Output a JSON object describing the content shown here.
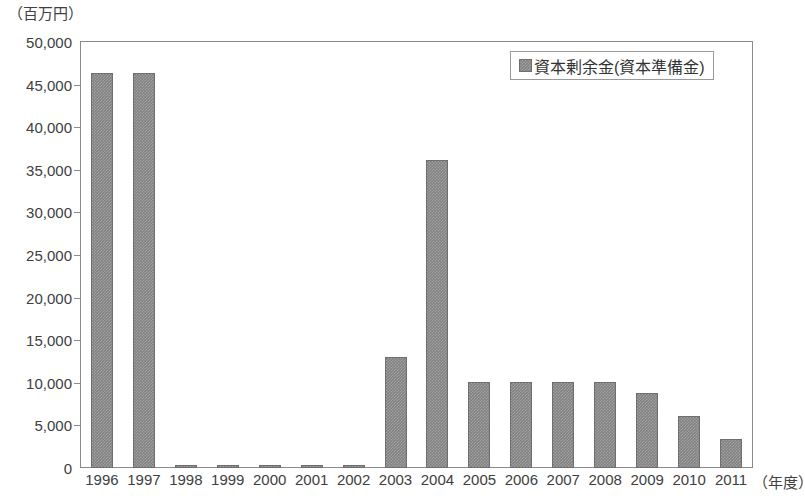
{
  "chart_data": {
    "type": "bar",
    "title": "",
    "unit_label": "（百万円）",
    "xlabel": "（年度）",
    "ylabel": "",
    "grid": false,
    "legend_position": "top-right",
    "categories": [
      "1996",
      "1997",
      "1998",
      "1999",
      "2000",
      "2001",
      "2002",
      "2003",
      "2004",
      "2005",
      "2006",
      "2007",
      "2008",
      "2009",
      "2010",
      "2011"
    ],
    "series": [
      {
        "name": "資本剰余金(資本準備金)",
        "color": "#828282",
        "values": [
          46400,
          46400,
          300,
          300,
          300,
          300,
          300,
          13000,
          36200,
          10100,
          10100,
          10100,
          10100,
          8800,
          6100,
          3400
        ]
      }
    ],
    "ylim": [
      0,
      50000
    ],
    "ytick_values": [
      0,
      5000,
      10000,
      15000,
      20000,
      25000,
      30000,
      35000,
      40000,
      45000,
      50000
    ],
    "ytick_labels": [
      "0",
      "5,000",
      "10,000",
      "15,000",
      "20,000",
      "25,000",
      "30,000",
      "35,000",
      "40,000",
      "45,000",
      "50,000"
    ]
  },
  "legend": {
    "entries": [
      {
        "label": "資本剰余金(資本準備金)",
        "swatch_color": "#828282"
      }
    ]
  }
}
